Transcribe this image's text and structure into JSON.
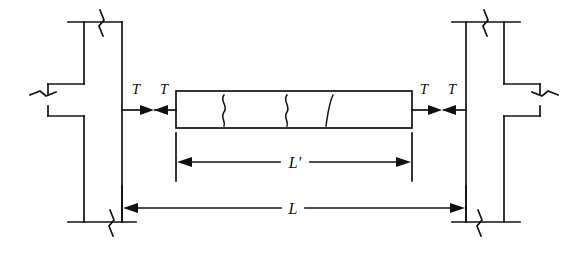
{
  "figure": {
    "type": "structural-engineering-diagram",
    "background_color": "#ffffff",
    "line_color": "#111111"
  },
  "labels": {
    "force_left_outer": "T",
    "force_left_inner": "T",
    "force_right_inner": "T",
    "force_right_outer": "T",
    "dimension_clear_span": "L′",
    "dimension_full_span": "L"
  },
  "elements": {
    "left_column": "left-column",
    "right_column": "right-column",
    "beam": "cracked-beam",
    "cracks": 3,
    "break_symbols": 6,
    "force_arrows": 4,
    "dimension_lines": 2
  }
}
